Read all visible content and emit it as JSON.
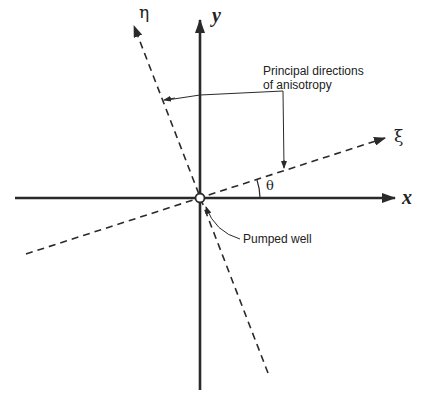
{
  "diagram": {
    "axes": {
      "x_label": "x",
      "y_label": "y",
      "xi_label": "ξ",
      "eta_label": "η",
      "angle_label": "θ"
    },
    "annotations": {
      "principal_directions_line1": "Principal directions",
      "principal_directions_line2": "of anisotropy",
      "pumped_well": "Pumped well"
    },
    "colors": {
      "line": "#2a2a2a",
      "text": "#222222",
      "background": "#ffffff"
    }
  }
}
